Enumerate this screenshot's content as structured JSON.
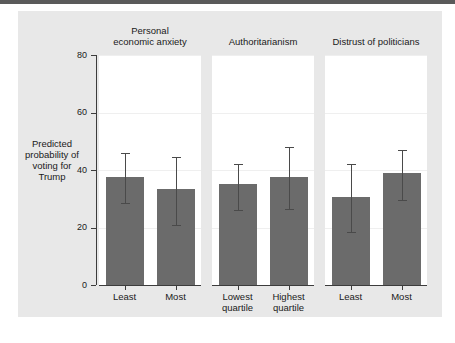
{
  "chart_data": {
    "type": "bar",
    "title": "",
    "subtitle": "",
    "xlabel": "",
    "ylabel": "Predicted probability of voting for Trump",
    "ylim": [
      0,
      80
    ],
    "yticks": [
      0,
      20,
      40,
      60,
      80
    ],
    "ytick_labels": [
      "0",
      "20",
      "40",
      "60",
      "80"
    ],
    "grid": true,
    "legend": "none",
    "error_bars": "95% confidence interval",
    "panels": [
      {
        "title": "Personal economic anxiety",
        "title_lines": [
          "Personal",
          "economic anxiety"
        ],
        "categories": [
          "Least",
          "Most"
        ],
        "category_lines": [
          [
            "Least"
          ],
          [
            "Most"
          ]
        ],
        "values": [
          37.5,
          33.5
        ],
        "ci_low": [
          28.5,
          21.0
        ],
        "ci_high": [
          46.0,
          44.5
        ]
      },
      {
        "title": "Authoritarianism",
        "title_lines": [
          "Authoritarianism"
        ],
        "categories": [
          "Lowest quartile",
          "Highest quartile"
        ],
        "category_lines": [
          [
            "Lowest",
            "quartile"
          ],
          [
            "Highest",
            "quartile"
          ]
        ],
        "values": [
          35.0,
          37.5
        ],
        "ci_low": [
          26.0,
          26.5
        ],
        "ci_high": [
          42.0,
          48.0
        ]
      },
      {
        "title": "Distrust of politicians",
        "title_lines": [
          "Distrust of politicians"
        ],
        "categories": [
          "Least",
          "Most"
        ],
        "category_lines": [
          [
            "Least"
          ],
          [
            "Most"
          ]
        ],
        "values": [
          30.5,
          39.0
        ],
        "ci_low": [
          18.5,
          29.5
        ],
        "ci_high": [
          42.0,
          47.0
        ]
      }
    ],
    "colors": {
      "bar_fill": "#6b6b6b",
      "error_bar": "#4a4a4a",
      "axis": "#3c3c3c",
      "grid": "#efefef",
      "panel_background": "#ffffff",
      "figure_background": "#e8e8e8",
      "top_rule": "#5a5a5a"
    }
  }
}
